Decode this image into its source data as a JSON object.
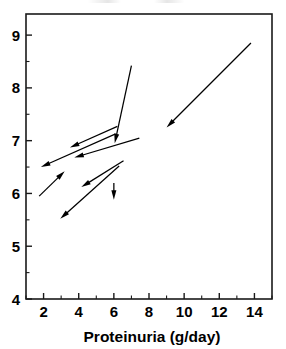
{
  "chart_data": {
    "type": "scatter",
    "subtype": "vector-field-arrows",
    "title": "",
    "xlabel": "Proteinuria (g/day)",
    "ylabel": "",
    "xlim": [
      1.0,
      15.0
    ],
    "ylim": [
      4.0,
      9.4
    ],
    "xticks": [
      2,
      4,
      6,
      8,
      10,
      12,
      14
    ],
    "xtick_labels": [
      "2",
      "4",
      "6",
      "8",
      "10",
      "12",
      "14"
    ],
    "yticks": [
      4,
      5,
      6,
      7,
      8,
      9
    ],
    "ytick_labels": [
      "4",
      "5",
      "6",
      "7",
      "8",
      "9"
    ],
    "x_minor_tick_interval": 1,
    "y_minor_tick_interval": 0.5,
    "grid": false,
    "legend": null,
    "annotations": [],
    "arrows": [
      {
        "label": "arrow-1",
        "x_start": 13.8,
        "y_start": 8.85,
        "x_end": 9.0,
        "y_end": 7.25
      },
      {
        "label": "arrow-2",
        "x_start": 7.0,
        "y_start": 8.42,
        "x_end": 6.05,
        "y_end": 6.95
      },
      {
        "label": "arrow-3",
        "x_start": 6.2,
        "y_start": 7.27,
        "x_end": 3.5,
        "y_end": 6.87
      },
      {
        "label": "arrow-4",
        "x_start": 6.1,
        "y_start": 7.13,
        "x_end": 1.85,
        "y_end": 6.5
      },
      {
        "label": "arrow-5",
        "x_start": 7.45,
        "y_start": 7.05,
        "x_end": 3.75,
        "y_end": 6.68
      },
      {
        "label": "arrow-6",
        "x_start": 1.75,
        "y_start": 5.95,
        "x_end": 3.2,
        "y_end": 6.42
      },
      {
        "label": "arrow-7",
        "x_start": 6.55,
        "y_start": 6.62,
        "x_end": 4.15,
        "y_end": 6.12
      },
      {
        "label": "arrow-8",
        "x_start": 6.0,
        "y_start": 6.2,
        "x_end": 6.0,
        "y_end": 5.88
      },
      {
        "label": "arrow-9",
        "x_start": 6.3,
        "y_start": 6.52,
        "x_end": 2.95,
        "y_end": 5.52
      }
    ],
    "colors": {
      "arrow": "#000000",
      "axis": "#1a1a1a",
      "background": "#ffffff"
    }
  }
}
